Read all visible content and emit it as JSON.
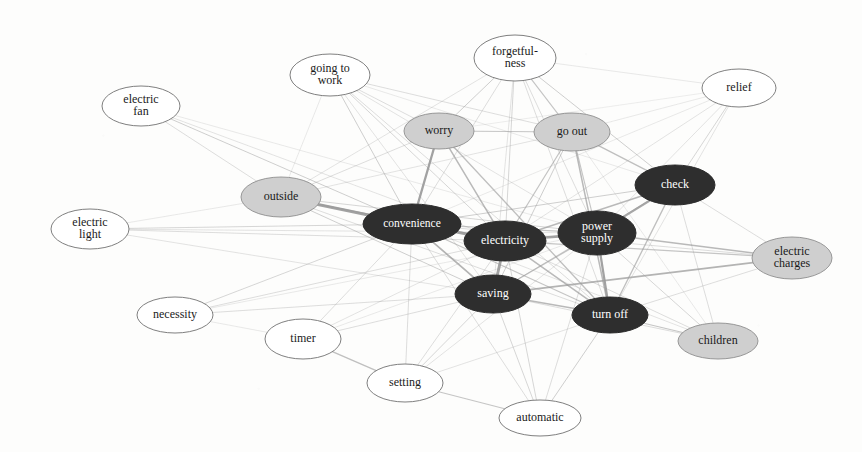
{
  "figure": {
    "type": "network-graph",
    "title": "",
    "background_color": "#fdfdfc",
    "width": 862,
    "height": 452,
    "legend": {
      "visible": false,
      "groups": [
        {
          "name": "core",
          "fill": "#2f2f2f",
          "text_color": "#ffffff",
          "description": "dark filled nodes"
        },
        {
          "name": "mid",
          "fill": "#cfcfcf",
          "text_color": "#1a1a1a",
          "description": "gray filled nodes"
        },
        {
          "name": "peripheral",
          "fill": "#ffffff",
          "text_color": "#1a1a1a",
          "description": "white unfilled nodes"
        }
      ]
    },
    "edge_color": "#9a9a9a"
  },
  "chart_data": {
    "type": "network",
    "title": "",
    "xlabel": "",
    "ylabel": "",
    "node_count": 19,
    "edge_count": 74,
    "nodes": [
      {
        "id": "electric-fan",
        "label": "electric\nfan",
        "label_lines": [
          "electric",
          "fan"
        ],
        "group": "peripheral",
        "cx": 141,
        "cy": 106,
        "rx": 39,
        "ry": 20
      },
      {
        "id": "going-to-work",
        "label": "going to\nwork",
        "label_lines": [
          "going to",
          "work"
        ],
        "group": "peripheral",
        "cx": 330,
        "cy": 75,
        "rx": 40,
        "ry": 21
      },
      {
        "id": "forgetfulness",
        "label": "forgetful-\nness",
        "label_lines": [
          "forgetful-",
          "ness"
        ],
        "group": "peripheral",
        "cx": 515,
        "cy": 58,
        "rx": 41,
        "ry": 23
      },
      {
        "id": "relief",
        "label": "relief",
        "label_lines": [
          "relief"
        ],
        "group": "peripheral",
        "cx": 739,
        "cy": 88,
        "rx": 37,
        "ry": 19
      },
      {
        "id": "electric-light",
        "label": "electric\nlight",
        "label_lines": [
          "electric",
          "light"
        ],
        "group": "peripheral",
        "cx": 90,
        "cy": 229,
        "rx": 39,
        "ry": 20
      },
      {
        "id": "necessity",
        "label": "necessity",
        "label_lines": [
          "necessity"
        ],
        "group": "peripheral",
        "cx": 175,
        "cy": 315,
        "rx": 38,
        "ry": 18
      },
      {
        "id": "timer",
        "label": "timer",
        "label_lines": [
          "timer"
        ],
        "group": "peripheral",
        "cx": 303,
        "cy": 339,
        "rx": 38,
        "ry": 20
      },
      {
        "id": "setting",
        "label": "setting",
        "label_lines": [
          "setting"
        ],
        "group": "peripheral",
        "cx": 405,
        "cy": 383,
        "rx": 38,
        "ry": 19
      },
      {
        "id": "automatic",
        "label": "automatic",
        "label_lines": [
          "automatic"
        ],
        "group": "peripheral",
        "cx": 540,
        "cy": 418,
        "rx": 41,
        "ry": 18
      },
      {
        "id": "outside",
        "label": "outside",
        "label_lines": [
          "outside"
        ],
        "group": "mid",
        "cx": 281,
        "cy": 197,
        "rx": 40,
        "ry": 20
      },
      {
        "id": "worry",
        "label": "worry",
        "label_lines": [
          "worry"
        ],
        "group": "mid",
        "cx": 439,
        "cy": 131,
        "rx": 35,
        "ry": 18
      },
      {
        "id": "go-out",
        "label": "go out",
        "label_lines": [
          "go out"
        ],
        "group": "mid",
        "cx": 572,
        "cy": 132,
        "rx": 38,
        "ry": 19
      },
      {
        "id": "electric-charges",
        "label": "electric\ncharges",
        "label_lines": [
          "electric",
          "charges"
        ],
        "group": "mid",
        "cx": 792,
        "cy": 258,
        "rx": 40,
        "ry": 21
      },
      {
        "id": "children",
        "label": "children",
        "label_lines": [
          "children"
        ],
        "group": "mid",
        "cx": 718,
        "cy": 341,
        "rx": 40,
        "ry": 18
      },
      {
        "id": "convenience",
        "label": "convenience",
        "label_lines": [
          "convenience"
        ],
        "group": "core",
        "cx": 412,
        "cy": 224,
        "rx": 49,
        "ry": 20
      },
      {
        "id": "electricity",
        "label": "electricity",
        "label_lines": [
          "electricity"
        ],
        "group": "core",
        "cx": 505,
        "cy": 241,
        "rx": 41,
        "ry": 20
      },
      {
        "id": "power-supply",
        "label": "power\nsupply",
        "label_lines": [
          "power",
          "supply"
        ],
        "group": "core",
        "cx": 597,
        "cy": 233,
        "rx": 39,
        "ry": 22
      },
      {
        "id": "check",
        "label": "check",
        "label_lines": [
          "check"
        ],
        "group": "core",
        "cx": 675,
        "cy": 185,
        "rx": 40,
        "ry": 20
      },
      {
        "id": "saving",
        "label": "saving",
        "label_lines": [
          "saving"
        ],
        "group": "core",
        "cx": 493,
        "cy": 294,
        "rx": 38,
        "ry": 19
      },
      {
        "id": "turn-off",
        "label": "turn off",
        "label_lines": [
          "turn off"
        ],
        "group": "core",
        "cx": 610,
        "cy": 315,
        "rx": 38,
        "ry": 18
      }
    ],
    "edges": [
      {
        "source": "outside",
        "target": "convenience",
        "weight": 3.2
      },
      {
        "source": "convenience",
        "target": "electricity",
        "weight": 3.0
      },
      {
        "source": "electricity",
        "target": "power-supply",
        "weight": 2.8
      },
      {
        "source": "electricity",
        "target": "saving",
        "weight": 3.0
      },
      {
        "source": "power-supply",
        "target": "turn-off",
        "weight": 2.4
      },
      {
        "source": "power-supply",
        "target": "check",
        "weight": 2.2
      },
      {
        "source": "worry",
        "target": "convenience",
        "weight": 2.4
      },
      {
        "source": "worry",
        "target": "electricity",
        "weight": 1.6
      },
      {
        "source": "worry",
        "target": "go-out",
        "weight": 1.2
      },
      {
        "source": "worry",
        "target": "turn-off",
        "weight": 1.4
      },
      {
        "source": "worry",
        "target": "forgetfulness",
        "weight": 1.0
      },
      {
        "source": "go-out",
        "target": "forgetfulness",
        "weight": 1.2
      },
      {
        "source": "go-out",
        "target": "check",
        "weight": 1.4
      },
      {
        "source": "go-out",
        "target": "turn-off",
        "weight": 1.6
      },
      {
        "source": "go-out",
        "target": "electricity",
        "weight": 1.3
      },
      {
        "source": "go-out",
        "target": "power-supply",
        "weight": 1.2
      },
      {
        "source": "go-out",
        "target": "saving",
        "weight": 1.0
      },
      {
        "source": "forgetfulness",
        "target": "check",
        "weight": 1.0
      },
      {
        "source": "forgetfulness",
        "target": "electricity",
        "weight": 0.9
      },
      {
        "source": "forgetfulness",
        "target": "convenience",
        "weight": 0.8
      },
      {
        "source": "forgetfulness",
        "target": "power-supply",
        "weight": 0.8
      },
      {
        "source": "forgetfulness",
        "target": "turn-off",
        "weight": 0.8
      },
      {
        "source": "forgetfulness",
        "target": "saving",
        "weight": 0.7
      },
      {
        "source": "forgetfulness",
        "target": "outside",
        "weight": 0.7
      },
      {
        "source": "forgetfulness",
        "target": "relief",
        "weight": 0.6
      },
      {
        "source": "relief",
        "target": "check",
        "weight": 0.9
      },
      {
        "source": "relief",
        "target": "electricity",
        "weight": 0.7
      },
      {
        "source": "relief",
        "target": "power-supply",
        "weight": 0.7
      },
      {
        "source": "relief",
        "target": "turn-off",
        "weight": 0.7
      },
      {
        "source": "relief",
        "target": "go-out",
        "weight": 0.6
      },
      {
        "source": "relief",
        "target": "convenience",
        "weight": 0.6
      },
      {
        "source": "relief",
        "target": "worry",
        "weight": 0.5
      },
      {
        "source": "check",
        "target": "electricity",
        "weight": 1.6
      },
      {
        "source": "check",
        "target": "convenience",
        "weight": 1.0
      },
      {
        "source": "check",
        "target": "turn-off",
        "weight": 1.4
      },
      {
        "source": "check",
        "target": "saving",
        "weight": 0.9
      },
      {
        "source": "check",
        "target": "children",
        "weight": 0.8
      },
      {
        "source": "check",
        "target": "electric-charges",
        "weight": 0.8
      },
      {
        "source": "electric-charges",
        "target": "power-supply",
        "weight": 1.6
      },
      {
        "source": "electric-charges",
        "target": "saving",
        "weight": 1.8
      },
      {
        "source": "electric-charges",
        "target": "electricity",
        "weight": 1.2
      },
      {
        "source": "electric-charges",
        "target": "convenience",
        "weight": 0.8
      },
      {
        "source": "electric-charges",
        "target": "turn-off",
        "weight": 0.8
      },
      {
        "source": "children",
        "target": "turn-off",
        "weight": 1.2
      },
      {
        "source": "children",
        "target": "power-supply",
        "weight": 0.9
      },
      {
        "source": "children",
        "target": "electricity",
        "weight": 0.8
      },
      {
        "source": "children",
        "target": "saving",
        "weight": 0.8
      },
      {
        "source": "children",
        "target": "convenience",
        "weight": 0.7
      },
      {
        "source": "children",
        "target": "go-out",
        "weight": 0.6
      },
      {
        "source": "automatic",
        "target": "setting",
        "weight": 1.2
      },
      {
        "source": "automatic",
        "target": "turn-off",
        "weight": 1.0
      },
      {
        "source": "automatic",
        "target": "saving",
        "weight": 0.9
      },
      {
        "source": "automatic",
        "target": "electricity",
        "weight": 0.9
      },
      {
        "source": "automatic",
        "target": "convenience",
        "weight": 0.8
      },
      {
        "source": "automatic",
        "target": "power-supply",
        "weight": 0.8
      },
      {
        "source": "setting",
        "target": "timer",
        "weight": 1.4
      },
      {
        "source": "setting",
        "target": "saving",
        "weight": 0.9
      },
      {
        "source": "setting",
        "target": "electricity",
        "weight": 0.8
      },
      {
        "source": "setting",
        "target": "convenience",
        "weight": 0.8
      },
      {
        "source": "setting",
        "target": "power-supply",
        "weight": 0.7
      },
      {
        "source": "setting",
        "target": "turn-off",
        "weight": 0.7
      },
      {
        "source": "timer",
        "target": "saving",
        "weight": 0.8
      },
      {
        "source": "timer",
        "target": "convenience",
        "weight": 0.8
      },
      {
        "source": "timer",
        "target": "electricity",
        "weight": 0.7
      },
      {
        "source": "timer",
        "target": "power-supply",
        "weight": 0.6
      },
      {
        "source": "necessity",
        "target": "convenience",
        "weight": 0.9
      },
      {
        "source": "necessity",
        "target": "electricity",
        "weight": 0.8
      },
      {
        "source": "necessity",
        "target": "saving",
        "weight": 0.8
      },
      {
        "source": "necessity",
        "target": "timer",
        "weight": 0.6
      },
      {
        "source": "necessity",
        "target": "power-supply",
        "weight": 0.6
      },
      {
        "source": "electric-light",
        "target": "convenience",
        "weight": 0.9
      },
      {
        "source": "electric-light",
        "target": "electricity",
        "weight": 0.8
      },
      {
        "source": "electric-light",
        "target": "saving",
        "weight": 0.7
      },
      {
        "source": "electric-light",
        "target": "power-supply",
        "weight": 0.7
      },
      {
        "source": "electric-light",
        "target": "outside",
        "weight": 0.6
      },
      {
        "source": "electric-fan",
        "target": "convenience",
        "weight": 1.0
      },
      {
        "source": "electric-fan",
        "target": "outside",
        "weight": 0.8
      },
      {
        "source": "electric-fan",
        "target": "electricity",
        "weight": 0.7
      },
      {
        "source": "electric-fan",
        "target": "power-supply",
        "weight": 0.6
      },
      {
        "source": "outside",
        "target": "electricity",
        "weight": 1.4
      },
      {
        "source": "outside",
        "target": "saving",
        "weight": 1.0
      },
      {
        "source": "outside",
        "target": "power-supply",
        "weight": 0.9
      },
      {
        "source": "outside",
        "target": "turn-off",
        "weight": 0.8
      },
      {
        "source": "outside",
        "target": "worry",
        "weight": 0.8
      },
      {
        "source": "outside",
        "target": "go-out",
        "weight": 0.7
      },
      {
        "source": "going-to-work",
        "target": "convenience",
        "weight": 1.0
      },
      {
        "source": "going-to-work",
        "target": "electricity",
        "weight": 0.9
      },
      {
        "source": "going-to-work",
        "target": "worry",
        "weight": 0.8
      },
      {
        "source": "going-to-work",
        "target": "go-out",
        "weight": 0.8
      },
      {
        "source": "going-to-work",
        "target": "turn-off",
        "weight": 0.8
      },
      {
        "source": "going-to-work",
        "target": "saving",
        "weight": 0.7
      },
      {
        "source": "going-to-work",
        "target": "power-supply",
        "weight": 0.7
      },
      {
        "source": "going-to-work",
        "target": "check",
        "weight": 0.6
      },
      {
        "source": "going-to-work",
        "target": "outside",
        "weight": 0.6
      },
      {
        "source": "convenience",
        "target": "saving",
        "weight": 1.8
      },
      {
        "source": "convenience",
        "target": "power-supply",
        "weight": 1.2
      },
      {
        "source": "convenience",
        "target": "turn-off",
        "weight": 1.2
      },
      {
        "source": "electricity",
        "target": "turn-off",
        "weight": 1.6
      },
      {
        "source": "saving",
        "target": "turn-off",
        "weight": 1.6
      },
      {
        "source": "saving",
        "target": "power-supply",
        "weight": 1.3
      }
    ]
  }
}
